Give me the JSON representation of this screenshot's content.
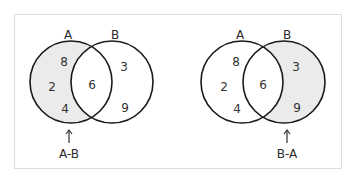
{
  "diagrams": [
    {
      "id": "left",
      "set_labels": {
        "a": "A",
        "b": "B"
      },
      "regions": {
        "a_only": [
          "8",
          "2",
          "4"
        ],
        "intersection": [
          "6"
        ],
        "b_only": [
          "3",
          "9"
        ]
      },
      "shaded": "a_only",
      "caption": "A-B",
      "arrow": "↑"
    },
    {
      "id": "right",
      "set_labels": {
        "a": "A",
        "b": "B"
      },
      "regions": {
        "a_only": [
          "8",
          "2",
          "4"
        ],
        "intersection": [
          "6"
        ],
        "b_only": [
          "3",
          "9"
        ]
      },
      "shaded": "b_only",
      "caption": "B-A",
      "arrow": "↑"
    }
  ],
  "colors": {
    "shade": "#ebebeb",
    "stroke": "#1a1a1a",
    "frame": "#dcdcdc"
  }
}
